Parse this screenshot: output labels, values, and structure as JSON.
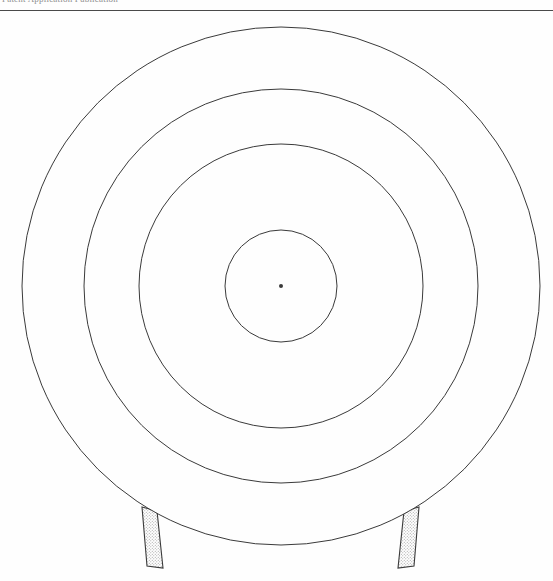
{
  "page": {
    "width": 553,
    "height": 581,
    "background_color": "#fefefe",
    "ink_color": "#3a3a3a",
    "hatch_color": "#9a9a9a"
  },
  "header": {
    "running_text": "Patent Application Publication",
    "rule_y": 10
  },
  "figure": {
    "center": {
      "x": 281,
      "y": 286,
      "label": "center-point"
    },
    "center_dot_radius": 2,
    "rings": [
      {
        "name": "outer-ring",
        "radius": 259,
        "stroke": "#3a3a3a",
        "stroke_width": 1,
        "fill": "none"
      },
      {
        "name": "second-ring",
        "radius": 197,
        "stroke": "#3a3a3a",
        "stroke_width": 1,
        "fill": "none"
      },
      {
        "name": "third-ring",
        "radius": 142,
        "stroke": "#3a3a3a",
        "stroke_width": 1,
        "fill": "none"
      },
      {
        "name": "bullseye-ring",
        "radius": 56,
        "stroke": "#3a3a3a",
        "stroke_width": 1,
        "fill": "none"
      }
    ],
    "legs": [
      {
        "name": "left-leg",
        "points": "142,507 157,511 163,568 147,566",
        "fill_pattern": "stipple",
        "stroke": "#3a3a3a"
      },
      {
        "name": "right-leg",
        "points": "404,511 419,507 414,566 398,568",
        "fill_pattern": "stipple",
        "stroke": "#3a3a3a"
      }
    ]
  },
  "chart_data": {
    "type": "scatter",
    "xlabel": "",
    "ylabel": "",
    "categories": [
      "outer-ring",
      "second-ring",
      "third-ring",
      "bullseye-ring",
      "center-point"
    ],
    "values": [
      259,
      197,
      142,
      56,
      0
    ],
    "series": [
      {
        "name": "ring radius (px)",
        "values": [
          259,
          197,
          142,
          56,
          0
        ]
      }
    ],
    "annotations": [
      "left-leg",
      "right-leg"
    ],
    "grid": false,
    "legend_position": "none"
  }
}
